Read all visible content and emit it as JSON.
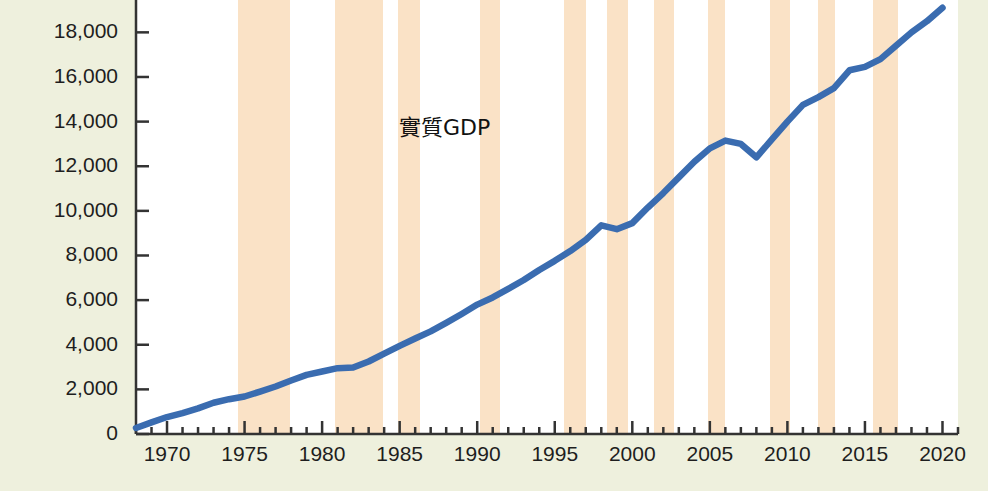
{
  "colors": {
    "page_background": "#eef0dd",
    "plot_background": "#ffffff",
    "line": "#3a6cb0",
    "recession_band": "#fae2c6",
    "axis": "#333333",
    "tick_label": "#1e1e1e"
  },
  "chart_data": {
    "type": "line",
    "title": "",
    "annotations": [
      {
        "text": "實質GDP",
        "x": 1988.5,
        "y": 13900
      }
    ],
    "xlabel": "",
    "ylabel": "",
    "xlim": [
      1968,
      2021
    ],
    "ylim": [
      0,
      19450
    ],
    "grid": false,
    "legend": null,
    "xtick_labels": [
      "1970",
      "1975",
      "1980",
      "1985",
      "1990",
      "1995",
      "2000",
      "2005",
      "2010",
      "2015",
      "2020"
    ],
    "xtick_values": [
      1970,
      1975,
      1980,
      1985,
      1990,
      1995,
      2000,
      2005,
      2010,
      2015,
      2020
    ],
    "xminor_step": 1,
    "ytick_labels": [
      "0",
      "2,000",
      "4,000",
      "6,000",
      "8,000",
      "10,000",
      "12,000",
      "14,000",
      "16,000",
      "18,000"
    ],
    "ytick_values": [
      0,
      2000,
      4000,
      6000,
      8000,
      10000,
      12000,
      14000,
      16000,
      18000
    ],
    "series": [
      {
        "name": "實質GDP",
        "color": "#3a6cb0",
        "x": [
          1968,
          1969,
          1970,
          1971,
          1972,
          1973,
          1974,
          1975,
          1976,
          1977,
          1978,
          1979,
          1980,
          1981,
          1982,
          1983,
          1984,
          1985,
          1986,
          1987,
          1988,
          1989,
          1990,
          1991,
          1992,
          1993,
          1994,
          1995,
          1996,
          1997,
          1998,
          1999,
          2000,
          2001,
          2002,
          2003,
          2004,
          2005,
          2006,
          2007,
          2008,
          2009,
          2010,
          2011,
          2012,
          2013,
          2014,
          2015,
          2016,
          2017,
          2018,
          2019,
          2020
        ],
        "values": [
          270,
          520,
          760,
          940,
          1150,
          1400,
          1560,
          1680,
          1900,
          2130,
          2400,
          2650,
          2800,
          2950,
          2980,
          3250,
          3600,
          3950,
          4280,
          4600,
          4980,
          5380,
          5800,
          6120,
          6500,
          6900,
          7350,
          7760,
          8200,
          8700,
          9350,
          9180,
          9450,
          10150,
          10800,
          11500,
          12200,
          12800,
          13150,
          13000,
          12400,
          13200,
          14000,
          14750,
          15100,
          15500,
          16300,
          16450,
          16800,
          17400,
          18000,
          18500,
          19100
        ]
      }
    ],
    "recession_bands": [
      {
        "start": 1974.6,
        "end": 1977.9,
        "label": "recession-band-1"
      },
      {
        "start": 1980.8,
        "end": 1983.9,
        "label": "recession-band-2"
      },
      {
        "start": 1984.9,
        "end": 1986.3,
        "label": "recession-band-3"
      },
      {
        "start": 1990.2,
        "end": 1991.5,
        "label": "recession-band-4"
      },
      {
        "start": 1995.6,
        "end": 1997.0,
        "label": "recession-band-5"
      },
      {
        "start": 1998.4,
        "end": 1999.7,
        "label": "recession-band-6"
      },
      {
        "start": 2001.4,
        "end": 2002.7,
        "label": "recession-band-7"
      },
      {
        "start": 2004.9,
        "end": 2006.0,
        "label": "recession-band-8"
      },
      {
        "start": 2008.9,
        "end": 2010.2,
        "label": "recession-band-9"
      },
      {
        "start": 2012.0,
        "end": 2013.1,
        "label": "recession-band-10"
      },
      {
        "start": 2015.5,
        "end": 2017.1,
        "label": "recession-band-11"
      }
    ]
  },
  "watermark": {
    "text": ""
  }
}
